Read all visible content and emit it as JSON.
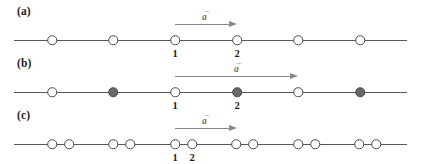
{
  "figure": {
    "width": 421,
    "height": 164,
    "background": "#ffffff",
    "line_color": "#585858",
    "node_outline_color": "#4a4a4a",
    "node_open_fill": "#ffffff",
    "node_filled_fill": "#686868",
    "arrow_color": "#8a8a8a",
    "text_color": "#1d1d1d"
  },
  "panels": [
    {
      "id": "a",
      "label": "(a)",
      "line_y": 40,
      "nodes": [
        {
          "x": 52,
          "type": "open",
          "label": ""
        },
        {
          "x": 113,
          "type": "open",
          "label": ""
        },
        {
          "x": 175,
          "type": "open",
          "label": "1"
        },
        {
          "x": 237,
          "type": "open",
          "label": "2"
        },
        {
          "x": 298,
          "type": "open",
          "label": ""
        },
        {
          "x": 360,
          "type": "open",
          "label": ""
        }
      ],
      "arrow": {
        "x_start": 175,
        "x_end": 237,
        "y": 24,
        "label": "a",
        "label_accent": "→",
        "label_x": 206,
        "label_y": 8
      }
    },
    {
      "id": "b",
      "label": "(b)",
      "line_y": 40,
      "nodes": [
        {
          "x": 52,
          "type": "open",
          "label": ""
        },
        {
          "x": 113,
          "type": "filled",
          "label": ""
        },
        {
          "x": 175,
          "type": "open",
          "label": "1"
        },
        {
          "x": 237,
          "type": "filled",
          "label": "2"
        },
        {
          "x": 298,
          "type": "open",
          "label": ""
        },
        {
          "x": 360,
          "type": "filled",
          "label": ""
        }
      ],
      "arrow": {
        "x_start": 175,
        "x_end": 298,
        "y": 24,
        "label": "a",
        "label_accent": "→",
        "label_x": 238,
        "label_y": 8
      }
    },
    {
      "id": "c",
      "label": "(c)",
      "line_y": 40,
      "nodes": [
        {
          "x": 52,
          "type": "open",
          "label": ""
        },
        {
          "x": 69,
          "type": "open",
          "label": ""
        },
        {
          "x": 113,
          "type": "open",
          "label": ""
        },
        {
          "x": 130,
          "type": "open",
          "label": ""
        },
        {
          "x": 175,
          "type": "open",
          "label": "1"
        },
        {
          "x": 192,
          "type": "open",
          "label": "2"
        },
        {
          "x": 236,
          "type": "open",
          "label": ""
        },
        {
          "x": 253,
          "type": "open",
          "label": ""
        },
        {
          "x": 298,
          "type": "open",
          "label": ""
        },
        {
          "x": 315,
          "type": "open",
          "label": ""
        },
        {
          "x": 359,
          "type": "open",
          "label": ""
        },
        {
          "x": 376,
          "type": "open",
          "label": ""
        }
      ],
      "arrow": {
        "x_start": 175,
        "x_end": 237,
        "y": 24,
        "label": "a",
        "label_accent": "→",
        "label_x": 206,
        "label_y": 8
      }
    }
  ]
}
